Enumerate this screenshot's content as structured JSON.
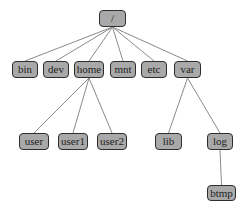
{
  "diagram": {
    "type": "tree",
    "colors": {
      "node_fill": "#a9a9a9",
      "node_border": "#2e2e2e",
      "edge": "#8a8a8a",
      "text": "#222222"
    },
    "nodes": [
      {
        "id": "root",
        "label": "/",
        "x": 99,
        "y": 10,
        "w": 27,
        "h": 17
      },
      {
        "id": "bin",
        "label": "bin",
        "x": 12,
        "y": 61,
        "w": 26,
        "h": 17
      },
      {
        "id": "dev",
        "label": "dev",
        "x": 43,
        "y": 61,
        "w": 26,
        "h": 17
      },
      {
        "id": "home",
        "label": "home",
        "x": 74,
        "y": 61,
        "w": 30,
        "h": 17
      },
      {
        "id": "mnt",
        "label": "mnt",
        "x": 110,
        "y": 61,
        "w": 26,
        "h": 17
      },
      {
        "id": "etc",
        "label": "etc",
        "x": 141,
        "y": 61,
        "w": 26,
        "h": 17
      },
      {
        "id": "var",
        "label": "var",
        "x": 174,
        "y": 61,
        "w": 27,
        "h": 17
      },
      {
        "id": "user",
        "label": "user",
        "x": 19,
        "y": 133,
        "w": 30,
        "h": 17
      },
      {
        "id": "user1",
        "label": "user1",
        "x": 58,
        "y": 133,
        "w": 30,
        "h": 17
      },
      {
        "id": "user2",
        "label": "user2",
        "x": 97,
        "y": 133,
        "w": 30,
        "h": 17
      },
      {
        "id": "lib",
        "label": "lib",
        "x": 155,
        "y": 133,
        "w": 27,
        "h": 17
      },
      {
        "id": "log",
        "label": "log",
        "x": 207,
        "y": 133,
        "w": 26,
        "h": 17
      },
      {
        "id": "btmp",
        "label": "btmp",
        "x": 207,
        "y": 185,
        "w": 29,
        "h": 16
      }
    ],
    "edges": [
      [
        "root",
        "bin"
      ],
      [
        "root",
        "dev"
      ],
      [
        "root",
        "home"
      ],
      [
        "root",
        "mnt"
      ],
      [
        "root",
        "etc"
      ],
      [
        "root",
        "var"
      ],
      [
        "home",
        "user"
      ],
      [
        "home",
        "user1"
      ],
      [
        "home",
        "user2"
      ],
      [
        "var",
        "lib"
      ],
      [
        "var",
        "log"
      ],
      [
        "log",
        "btmp"
      ]
    ]
  }
}
